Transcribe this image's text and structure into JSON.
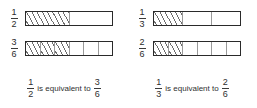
{
  "diagram": {
    "title_text": "",
    "panels": [
      {
        "id": "panel-left",
        "rows": [
          {
            "id": "row-half",
            "fraction": {
              "numerator": "1",
              "denominator": "2"
            },
            "bar": {
              "total_parts": 2,
              "shaded_parts": 1
            }
          },
          {
            "id": "row-three-sixths",
            "fraction": {
              "numerator": "3",
              "denominator": "6"
            },
            "bar": {
              "total_parts": 6,
              "shaded_parts": 3
            }
          }
        ],
        "caption": {
          "left_fraction": {
            "numerator": "1",
            "denominator": "2"
          },
          "words": "is equivalent to",
          "right_fraction": {
            "numerator": "3",
            "denominator": "6"
          }
        }
      },
      {
        "id": "panel-right",
        "rows": [
          {
            "id": "row-third",
            "fraction": {
              "numerator": "1",
              "denominator": "3"
            },
            "bar": {
              "total_parts": 3,
              "shaded_parts": 1
            }
          },
          {
            "id": "row-two-sixths",
            "fraction": {
              "numerator": "2",
              "denominator": "6"
            },
            "bar": {
              "total_parts": 6,
              "shaded_parts": 2
            }
          }
        ],
        "caption": {
          "left_fraction": {
            "numerator": "1",
            "denominator": "3"
          },
          "words": "is equivalent to",
          "right_fraction": {
            "numerator": "2",
            "denominator": "6"
          }
        }
      }
    ],
    "colors": {
      "bar_border": "#2a2a2a",
      "cell_divider": "#9a9a9a",
      "hatch": "#6e6e6e",
      "text": "#2f2f2f",
      "background": "#ffffff"
    }
  }
}
